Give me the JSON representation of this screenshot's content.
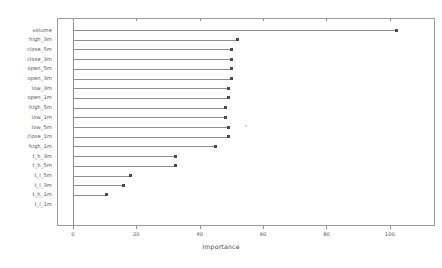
{
  "chart_data": {
    "type": "bar",
    "title": "",
    "subtitle": "",
    "xlabel": "Importance",
    "ylabel": "",
    "orientation": "horizontal",
    "style": "lollipop",
    "grid": false,
    "legend": null,
    "xlim": [
      0,
      113
    ],
    "xticks": [
      0,
      20,
      40,
      60,
      80,
      100
    ],
    "xticklabels": [
      "0",
      "20",
      "40",
      "60",
      "80",
      "100"
    ],
    "categories": [
      "volume",
      "high_3m",
      "close_5m",
      "close_3m",
      "open_5m",
      "open_3m",
      "low_3m",
      "open_1m",
      "high_5m",
      "low_1m",
      "low_5m",
      "close_5m",
      "high_1m",
      "t_h_3m",
      "t_h_5m",
      "t_l_5m",
      "t_l_3m",
      "t_h_1m",
      "t_l_1m"
    ],
    "values": [
      102,
      52,
      50,
      50,
      50,
      50,
      49,
      49,
      48,
      48,
      49,
      49,
      45,
      32.5,
      32.5,
      18,
      16,
      10.5,
      0
    ],
    "series": [
      {
        "name": "Importance",
        "values": [
          102,
          52,
          50,
          50,
          50,
          50,
          49,
          49,
          48,
          48,
          49,
          49,
          45,
          32.5,
          32.5,
          18,
          16,
          10.5,
          0
        ]
      }
    ],
    "rows": [
      {
        "label": "volume",
        "value": 102
      },
      {
        "label": "high_3m",
        "value": 52
      },
      {
        "label": "close_5m",
        "value": 50
      },
      {
        "label": "close_3m",
        "value": 50
      },
      {
        "label": "open_5m",
        "value": 50
      },
      {
        "label": "open_3m",
        "value": 50
      },
      {
        "label": "low_3m",
        "value": 49
      },
      {
        "label": "open_1m",
        "value": 49
      },
      {
        "label": "high_5m",
        "value": 48
      },
      {
        "label": "low_1m",
        "value": 48
      },
      {
        "label": "low_5m",
        "value": 49
      },
      {
        "label": "close_1m",
        "value": 49
      },
      {
        "label": "high_1m",
        "value": 45
      },
      {
        "label": "t_h_3m",
        "value": 32.5
      },
      {
        "label": "t_h_5m",
        "value": 32.5
      },
      {
        "label": "t_l_5m",
        "value": 18
      },
      {
        "label": "t_l_3m",
        "value": 16
      },
      {
        "label": "t_h_1m",
        "value": 10.5
      },
      {
        "label": "t_l_1m",
        "value": 0
      }
    ],
    "colors": {
      "line": "#8e8e8e",
      "marker": "#4a4a4a",
      "axis": "#8c8c8c",
      "frame": "#9a9a9a",
      "text": "#555555",
      "background": "#ffffff"
    }
  }
}
